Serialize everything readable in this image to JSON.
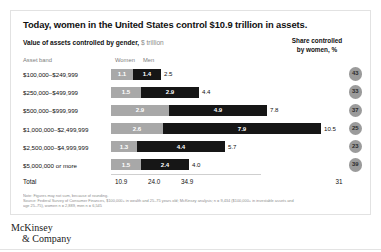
{
  "card": {
    "title": "Today, women in the United States control $10.9 trillion in assets.",
    "subtitle_bold": "Value of assets controlled by gender,",
    "subtitle_unit": " $ trillion",
    "share_header_line1": "Share controlled",
    "share_header_line2": "by women, %",
    "columns": {
      "band": "Asset band",
      "women": "Women",
      "men": "Men"
    },
    "total": {
      "label": "Total",
      "women": "10.9",
      "men": "24.0",
      "sum": "34.9",
      "share": "31"
    },
    "notes": [
      "Note: Figures may not sum, because of rounding.",
      "Source: Federal Survey of Consumer Finances, $100,000+ in wealth and 25–75 years old; McKinsey analysis; n = 9,434 ($100,000+ in investable assets and",
      "age 25–75), women n = 2,889, men n = 6,545"
    ],
    "logo_line1": "McKinsey",
    "logo_line2": "& Company"
  },
  "chart_data": {
    "type": "bar",
    "title": "Value of assets controlled by gender, $ trillion",
    "xlabel": "",
    "ylabel": "Asset band",
    "categories": [
      "$100,000–$249,999",
      "$250,000–$499,999",
      "$500,000–$999,999",
      "$1,000,000–$2,499,999",
      "$2,500,000–$4,999,999",
      "$5,000,000 or more"
    ],
    "series": [
      {
        "name": "Women",
        "values": [
          1.1,
          1.5,
          2.9,
          2.6,
          1.3,
          1.5
        ]
      },
      {
        "name": "Men",
        "values": [
          1.4,
          2.9,
          4.9,
          7.9,
          4.4,
          2.4
        ]
      }
    ],
    "totals": [
      2.5,
      4.4,
      7.8,
      10.5,
      5.7,
      4.0
    ],
    "share_by_women_pct": [
      43,
      33,
      37,
      25,
      23,
      39
    ],
    "totals_row": {
      "women": 10.9,
      "men": 24.0,
      "total": 34.9,
      "share": 31
    },
    "xlim": [
      0,
      10.5
    ],
    "grid": false,
    "legend_position": "top",
    "colors": {
      "women": "#a8a8a8",
      "men": "#161616",
      "circle": "#9b9b9b"
    }
  }
}
